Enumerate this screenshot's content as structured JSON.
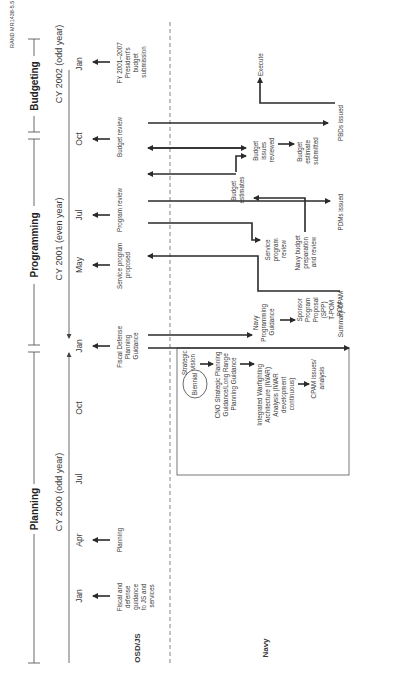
{
  "figure_id": "RAND MR1438-5.5",
  "phases": [
    {
      "label": "Planning"
    },
    {
      "label": "Programming"
    },
    {
      "label": "Budgeting"
    }
  ],
  "years": [
    {
      "label": "CY 2000 (odd year)"
    },
    {
      "label": "CY 2001 (even year)"
    },
    {
      "label": "CY 2002 (odd year)"
    }
  ],
  "months": [
    "Jan",
    "Apr",
    "Jul",
    "Oct",
    "Jan",
    "May",
    "Jul",
    "Oct",
    "Jan"
  ],
  "rows": {
    "top": "OSD/JS",
    "bottom": "Navy"
  },
  "osd_events": {
    "fiscal_defense_guidance": [
      "Fiscal and",
      "defense",
      "guidance",
      "to JS and",
      "services"
    ],
    "planning": [
      "Planning"
    ],
    "fdpg": [
      "Fiscal Defense",
      "Planning",
      "Guidance"
    ],
    "service_program_proposed": [
      "Service program",
      "proposed"
    ],
    "program_review": [
      "Program review"
    ],
    "budget_review": [
      "Budget review"
    ],
    "presidents_budget": [
      "FY 2001–2007",
      "President's",
      "budget",
      "submission"
    ]
  },
  "navy_events": {
    "biennial": "Biennial",
    "strategic_vision": [
      "Strategic",
      "vision"
    ],
    "cno_guidance": [
      "CNO Strategic Planning",
      "Guidance/Long Range",
      "Planning Guidance"
    ],
    "iwar": [
      "Integrated Warfighting",
      "Architecture (IWAR)",
      "Analysis (IWAR",
      "development",
      "continuous)"
    ],
    "cpam_issues": [
      "CPAM issues/",
      "analysis"
    ],
    "summary_cpam": "Summary CPAM",
    "navy_programming_guidance": [
      "Navy",
      "Programming",
      "Guidance"
    ],
    "sponsor_program_proposal": [
      "Sponsor",
      "Program",
      "Proposal",
      "(SPP)",
      "T-POM",
      "POM"
    ],
    "service_program_review": [
      "Service",
      "program",
      "review"
    ],
    "navy_budget_prep": [
      "Navy budget",
      "preparation",
      "and review"
    ],
    "pdms_issued": "PDMs issued",
    "budget_estimates": [
      "Budget",
      "estimates"
    ],
    "budget_issues_reviewed": [
      "Budget",
      "issues",
      "reviewed"
    ],
    "budget_estimate_submitted": [
      "Budget",
      "estimate",
      "submitted"
    ],
    "pbds_issued": "PBDs issued",
    "execute": "Execute"
  }
}
